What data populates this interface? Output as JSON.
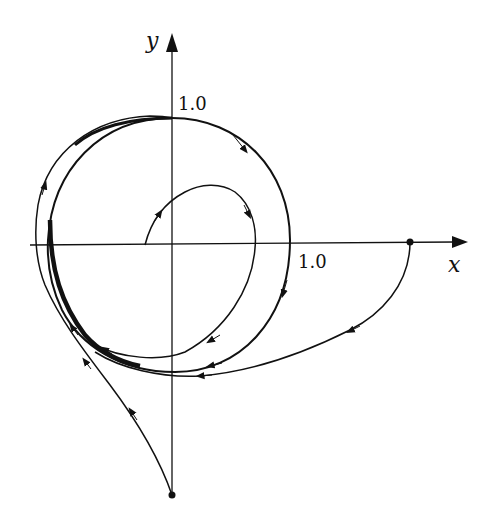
{
  "figure": {
    "type": "phase-portrait",
    "axes": {
      "x_label": "x",
      "y_label": "y",
      "x_tick_label": "1.0",
      "y_tick_label": "1.0"
    },
    "colors": {
      "ink": "#111111",
      "background": "#ffffff"
    },
    "trajectories": [
      {
        "name": "limit-cycle",
        "description": "thick closed orbit, clockwise"
      },
      {
        "name": "inner-spiral",
        "start": "point on negative x-axis near origin",
        "direction": "spirals outward to limit cycle"
      },
      {
        "name": "right-start",
        "start": "point on positive x-axis beyond 1.0",
        "direction": "moves down and left onto limit cycle"
      },
      {
        "name": "bottom-start",
        "start": "point on negative y-axis",
        "direction": "moves up-left around onto limit cycle"
      }
    ]
  }
}
